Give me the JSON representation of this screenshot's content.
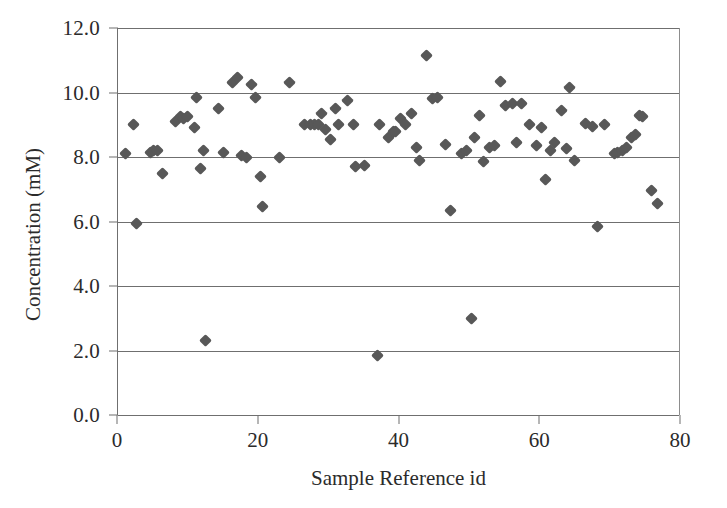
{
  "chart_data": {
    "type": "scatter",
    "title": "",
    "xlabel": "Sample Reference id",
    "ylabel": "Concentration (mM)",
    "xlim": [
      0,
      80
    ],
    "ylim": [
      0,
      12
    ],
    "xticks": [
      0,
      20,
      40,
      60,
      80
    ],
    "xticklabels": [
      "0",
      "20",
      "40",
      "60",
      "80"
    ],
    "yticks": [
      0,
      2,
      4,
      6,
      8,
      10,
      12
    ],
    "yticklabels": [
      "0.0",
      "2.0",
      "4.0",
      "6.0",
      "8.0",
      "10.0",
      "12.0"
    ],
    "grid": "horizontal",
    "legend": null,
    "marker": {
      "shape": "diamond",
      "color": "#585858",
      "size": 9
    },
    "series": [
      {
        "name": "Concentration",
        "points": [
          {
            "x": 1.0,
            "y": 8.1
          },
          {
            "x": 2.2,
            "y": 9.0
          },
          {
            "x": 2.6,
            "y": 5.95
          },
          {
            "x": 4.6,
            "y": 8.15
          },
          {
            "x": 5.1,
            "y": 8.2
          },
          {
            "x": 5.6,
            "y": 8.2
          },
          {
            "x": 6.3,
            "y": 7.5
          },
          {
            "x": 8.1,
            "y": 9.1
          },
          {
            "x": 8.9,
            "y": 9.25
          },
          {
            "x": 9.3,
            "y": 9.2
          },
          {
            "x": 9.9,
            "y": 9.25
          },
          {
            "x": 10.8,
            "y": 8.9
          },
          {
            "x": 11.1,
            "y": 9.85
          },
          {
            "x": 11.7,
            "y": 7.65
          },
          {
            "x": 12.1,
            "y": 8.2
          },
          {
            "x": 12.4,
            "y": 2.3
          },
          {
            "x": 14.3,
            "y": 9.5
          },
          {
            "x": 15.0,
            "y": 8.15
          },
          {
            "x": 16.3,
            "y": 10.3
          },
          {
            "x": 17.0,
            "y": 10.45
          },
          {
            "x": 17.6,
            "y": 8.05
          },
          {
            "x": 18.3,
            "y": 8.0
          },
          {
            "x": 19.0,
            "y": 10.25
          },
          {
            "x": 19.6,
            "y": 9.85
          },
          {
            "x": 20.2,
            "y": 7.4
          },
          {
            "x": 20.6,
            "y": 6.45
          },
          {
            "x": 23.0,
            "y": 8.0
          },
          {
            "x": 24.4,
            "y": 10.3
          },
          {
            "x": 26.5,
            "y": 9.0
          },
          {
            "x": 27.3,
            "y": 9.0
          },
          {
            "x": 27.9,
            "y": 9.0
          },
          {
            "x": 28.5,
            "y": 9.0
          },
          {
            "x": 28.9,
            "y": 9.35
          },
          {
            "x": 29.5,
            "y": 8.85
          },
          {
            "x": 30.2,
            "y": 8.55
          },
          {
            "x": 30.9,
            "y": 9.5
          },
          {
            "x": 31.4,
            "y": 9.0
          },
          {
            "x": 32.6,
            "y": 9.75
          },
          {
            "x": 33.5,
            "y": 9.0
          },
          {
            "x": 33.8,
            "y": 7.7
          },
          {
            "x": 35.0,
            "y": 7.75
          },
          {
            "x": 36.9,
            "y": 1.85
          },
          {
            "x": 37.2,
            "y": 9.0
          },
          {
            "x": 38.5,
            "y": 8.6
          },
          {
            "x": 39.1,
            "y": 8.8
          },
          {
            "x": 39.4,
            "y": 8.8
          },
          {
            "x": 40.2,
            "y": 9.2
          },
          {
            "x": 40.9,
            "y": 9.0
          },
          {
            "x": 41.7,
            "y": 9.35
          },
          {
            "x": 42.4,
            "y": 8.3
          },
          {
            "x": 42.9,
            "y": 7.9
          },
          {
            "x": 43.9,
            "y": 11.15
          },
          {
            "x": 44.7,
            "y": 9.8
          },
          {
            "x": 45.4,
            "y": 9.85
          },
          {
            "x": 46.5,
            "y": 8.4
          },
          {
            "x": 47.2,
            "y": 6.35
          },
          {
            "x": 48.8,
            "y": 8.1
          },
          {
            "x": 49.5,
            "y": 8.2
          },
          {
            "x": 50.2,
            "y": 2.98
          },
          {
            "x": 50.6,
            "y": 8.6
          },
          {
            "x": 51.4,
            "y": 9.3
          },
          {
            "x": 52.0,
            "y": 7.85
          },
          {
            "x": 52.8,
            "y": 8.3
          },
          {
            "x": 53.5,
            "y": 8.35
          },
          {
            "x": 54.3,
            "y": 10.35
          },
          {
            "x": 55.1,
            "y": 9.6
          },
          {
            "x": 56.0,
            "y": 9.65
          },
          {
            "x": 56.6,
            "y": 8.45
          },
          {
            "x": 57.4,
            "y": 9.65
          },
          {
            "x": 58.5,
            "y": 9.0
          },
          {
            "x": 59.4,
            "y": 8.35
          },
          {
            "x": 60.2,
            "y": 8.9
          },
          {
            "x": 60.8,
            "y": 7.3
          },
          {
            "x": 61.5,
            "y": 8.2
          },
          {
            "x": 62.0,
            "y": 8.45
          },
          {
            "x": 63.0,
            "y": 9.45
          },
          {
            "x": 63.8,
            "y": 8.25
          },
          {
            "x": 64.2,
            "y": 10.15
          },
          {
            "x": 64.9,
            "y": 7.9
          },
          {
            "x": 66.4,
            "y": 9.05
          },
          {
            "x": 67.4,
            "y": 8.95
          },
          {
            "x": 68.2,
            "y": 5.85
          },
          {
            "x": 69.2,
            "y": 9.0
          },
          {
            "x": 70.6,
            "y": 8.1
          },
          {
            "x": 71.0,
            "y": 8.15
          },
          {
            "x": 71.7,
            "y": 8.2
          },
          {
            "x": 72.2,
            "y": 8.3
          },
          {
            "x": 72.9,
            "y": 8.6
          },
          {
            "x": 73.5,
            "y": 8.7
          },
          {
            "x": 74.1,
            "y": 9.3
          },
          {
            "x": 74.6,
            "y": 9.25
          },
          {
            "x": 75.8,
            "y": 6.95
          },
          {
            "x": 76.6,
            "y": 6.55
          }
        ]
      }
    ]
  }
}
